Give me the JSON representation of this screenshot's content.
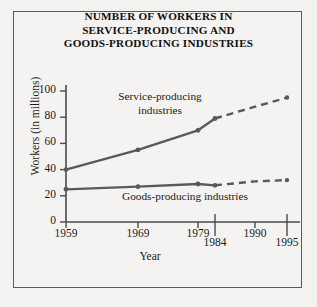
{
  "title": {
    "line1": "NUMBER OF WORKERS IN",
    "line2": "SERVICE-PRODUCING AND",
    "line3": "GOODS-PRODUCING INDUSTRIES"
  },
  "chart_data": {
    "type": "line",
    "title": "NUMBER OF WORKERS IN SERVICE-PRODUCING AND GOODS-PRODUCING INDUSTRIES",
    "xlabel": "Year",
    "ylabel": "Workers (in millions)",
    "x": [
      1959,
      1969,
      1979,
      1984,
      1990,
      1995
    ],
    "xticks": [
      "1959",
      "1969",
      "1979",
      "1984",
      "1990",
      "1995"
    ],
    "xtick_offset_rows": [
      0,
      0,
      0,
      1,
      0,
      1
    ],
    "yticks": [
      0,
      20,
      40,
      60,
      80,
      100
    ],
    "ylim": [
      0,
      105
    ],
    "xlim": [
      1957,
      1997
    ],
    "grid": false,
    "legend": "inline-labels",
    "projection_starts_at": 1984,
    "series": [
      {
        "name": "Service-producing industries",
        "label_line1": "Service-producing",
        "label_line2": "industries",
        "values": [
          40,
          55,
          70,
          79,
          88,
          95
        ],
        "color": "#59595b",
        "solid_through": 1984,
        "dashed_from": 1984
      },
      {
        "name": "Goods-producing industries",
        "label_line1": "Goods-producing industries",
        "label_line2": "",
        "values": [
          25,
          27,
          29,
          28,
          31,
          32
        ],
        "color": "#59595b",
        "solid_through": 1984,
        "dashed_from": 1984
      }
    ],
    "axis_color": "#4a4a4a"
  }
}
